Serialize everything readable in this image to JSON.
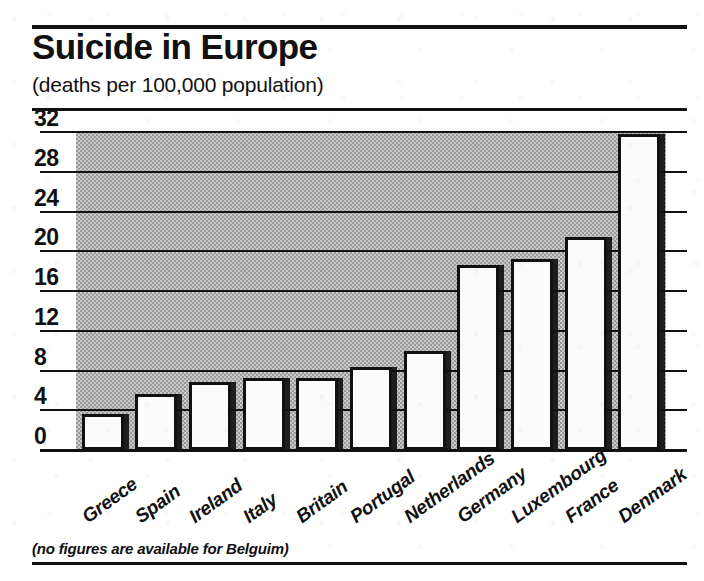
{
  "chart_data": {
    "type": "bar",
    "title": "Suicide in Europe",
    "subtitle": "(deaths per 100,000 population)",
    "xlabel": "",
    "ylabel": "",
    "ylim": [
      0,
      32
    ],
    "yticks": [
      0,
      4,
      8,
      12,
      16,
      20,
      24,
      28,
      32
    ],
    "ytick_labels": [
      "0",
      "4",
      "8",
      "12",
      "16",
      "20",
      "24",
      "28",
      "32"
    ],
    "grid": true,
    "legend": false,
    "categories": [
      "Greece",
      "Spain",
      "Ireland",
      "Italy",
      "Britain",
      "Portugal",
      "Netherlands",
      "Germany",
      "Luxembourg",
      "France",
      "Denmark"
    ],
    "values": [
      3.6,
      5.6,
      6.8,
      7.2,
      7.2,
      8.4,
      10.0,
      18.6,
      19.2,
      21.4,
      31.8
    ],
    "annotation": "(no figures are available for Belguim)",
    "bar_fill": "#fbfbfb",
    "bar_outline": "#111111",
    "plot_background": "#c8c8c8"
  },
  "header": {
    "title": "Suicide in Europe",
    "subtitle": "(deaths per 100,000 population)"
  },
  "axis": {
    "ticks": [
      "32",
      "28",
      "24",
      "20",
      "16",
      "12",
      "8",
      "4",
      "0"
    ]
  },
  "footer": {
    "note": "(no figures are available for Belguim)"
  }
}
